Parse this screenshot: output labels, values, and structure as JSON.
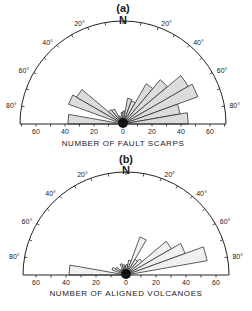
{
  "chart_data": [
    {
      "type": "rose",
      "panel_label": "(a)",
      "north_label": "N",
      "xlabel": "NUMBER OF FAULT SCARPS",
      "x_ticks": [
        "60",
        "40",
        "20",
        "0",
        "20",
        "40",
        "60"
      ],
      "angle_labels_left": [
        "20°",
        "40°",
        "60°",
        "80°"
      ],
      "angle_labels_right": [
        "20°",
        "40°",
        "60°",
        "80°"
      ],
      "bin_width_deg": 10,
      "radial_range": [
        0,
        70
      ],
      "azimuths_deg": [
        -85,
        -65,
        -55,
        -45,
        -35,
        -25,
        -15,
        -5,
        5,
        15,
        25,
        35,
        45,
        55,
        65,
        75,
        85
      ],
      "values": [
        38,
        40,
        37,
        13,
        12,
        6,
        4,
        8,
        9,
        18,
        17,
        32,
        40,
        52,
        55,
        40,
        45
      ]
    },
    {
      "type": "rose",
      "panel_label": "(b)",
      "north_label": "N",
      "xlabel": "NUMBER OF ALIGNED VOLCANOES",
      "x_ticks": [
        "60",
        "40",
        "20",
        "0",
        "20",
        "40",
        "60"
      ],
      "angle_labels_left": [
        "20°",
        "40°",
        "60°",
        "80°"
      ],
      "angle_labels_right": [
        "20°",
        "40°",
        "60°",
        "80°"
      ],
      "bin_width_deg": 10,
      "radial_range": [
        0,
        70
      ],
      "azimuths_deg": [
        -85,
        -65,
        -55,
        -45,
        -35,
        -25,
        -15,
        -5,
        5,
        15,
        25,
        35,
        45,
        55,
        65,
        75
      ],
      "values": [
        38,
        10,
        8,
        5,
        5,
        8,
        7,
        6,
        7,
        10,
        27,
        12,
        14,
        35,
        42,
        55
      ]
    }
  ],
  "panels": {
    "a": {
      "title": "(a)",
      "north": "N",
      "axis_title": "NUMBER OF FAULT SCARPS",
      "ticks": [
        "60",
        "40",
        "20",
        "0",
        "20",
        "40",
        "60"
      ],
      "deg_left": [
        "20°",
        "40°",
        "60°",
        "80°"
      ],
      "deg_right": [
        "20°",
        "40°",
        "60°",
        "80°"
      ]
    },
    "b": {
      "title": "(b)",
      "north": "N",
      "axis_title": "NUMBER OF ALIGNED VOLCANOES",
      "ticks": [
        "60",
        "40",
        "20",
        "0",
        "20",
        "40",
        "60"
      ],
      "deg_left": [
        "20°",
        "40°",
        "60°",
        "80°"
      ],
      "deg_right": [
        "20°",
        "40°",
        "60°",
        "80°"
      ]
    }
  }
}
